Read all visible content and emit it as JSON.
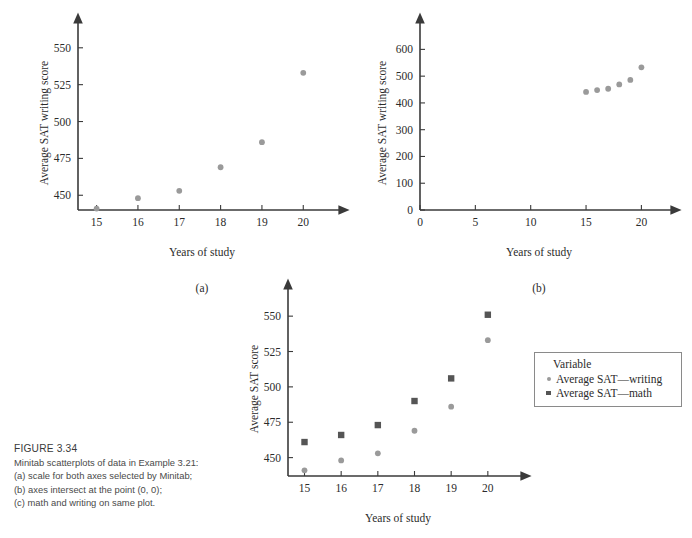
{
  "figure": {
    "label": "FIGURE 3.34",
    "caption_lines": [
      "Minitab scatterplots of data in Example 3.21:",
      "(a) scale for both axes selected by Minitab;",
      "(b) axes intersect at the point (0, 0);",
      "(c) math and writing on same plot."
    ]
  },
  "legend": {
    "title": "Variable",
    "items": [
      {
        "label": "Average SAT—writing",
        "marker": "circle",
        "color": "#9a9a9a"
      },
      {
        "label": "Average SAT—math",
        "marker": "square",
        "color": "#555555"
      }
    ]
  },
  "chart_data": [
    {
      "id": "a",
      "type": "scatter",
      "panel_label": "(a)",
      "title": "",
      "xlabel": "Years of study",
      "ylabel": "Average SAT writing score",
      "xlim": [
        14.55,
        20.55
      ],
      "ylim": [
        440,
        558
      ],
      "xticks": [
        15,
        16,
        17,
        18,
        19,
        20
      ],
      "xtick_labels": [
        "15",
        "16",
        "17",
        "18",
        "19",
        "20"
      ],
      "yticks": [
        450,
        475,
        500,
        525,
        550
      ],
      "ytick_labels": [
        "450",
        "475",
        "500",
        "525",
        "550"
      ],
      "grid": false,
      "series": [
        {
          "name": "Average SAT—writing",
          "marker": "circle",
          "color": "#9a9a9a",
          "x": [
            15,
            16,
            17,
            18,
            19,
            20
          ],
          "values": [
            441,
            448,
            453,
            469,
            486,
            533
          ]
        }
      ]
    },
    {
      "id": "b",
      "type": "scatter",
      "panel_label": "(b)",
      "title": "",
      "xlabel": "Years of study",
      "ylabel": "Average SAT writing score",
      "xlim": [
        0,
        21.5
      ],
      "ylim": [
        0,
        650
      ],
      "xticks": [
        0,
        5,
        10,
        15,
        20
      ],
      "xtick_labels": [
        "0",
        "5",
        "10",
        "15",
        "20"
      ],
      "yticks": [
        0,
        100,
        200,
        300,
        400,
        500,
        600
      ],
      "ytick_labels": [
        "0",
        "100",
        "200",
        "300",
        "400",
        "500",
        "600"
      ],
      "grid": false,
      "series": [
        {
          "name": "Average SAT—writing",
          "marker": "circle",
          "color": "#9a9a9a",
          "x": [
            15,
            16,
            17,
            18,
            19,
            20
          ],
          "values": [
            441,
            448,
            453,
            469,
            486,
            533
          ]
        }
      ]
    },
    {
      "id": "c",
      "type": "scatter",
      "panel_label": "(c)",
      "title": "",
      "xlabel": "Years of study",
      "ylabel": "Average SAT score",
      "xlim": [
        14.55,
        20.55
      ],
      "ylim": [
        437,
        560
      ],
      "xticks": [
        15,
        16,
        17,
        18,
        19,
        20
      ],
      "xtick_labels": [
        "15",
        "16",
        "17",
        "18",
        "19",
        "20"
      ],
      "yticks": [
        450,
        475,
        500,
        525,
        550
      ],
      "ytick_labels": [
        "450",
        "475",
        "500",
        "525",
        "550"
      ],
      "grid": false,
      "series": [
        {
          "name": "Average SAT—writing",
          "marker": "circle",
          "color": "#9a9a9a",
          "x": [
            15,
            16,
            17,
            18,
            19,
            20
          ],
          "values": [
            441,
            448,
            453,
            469,
            486,
            533
          ]
        },
        {
          "name": "Average SAT—math",
          "marker": "square",
          "color": "#555555",
          "x": [
            15,
            16,
            17,
            18,
            19,
            20
          ],
          "values": [
            461,
            466,
            473,
            490,
            506,
            551
          ]
        }
      ]
    }
  ]
}
